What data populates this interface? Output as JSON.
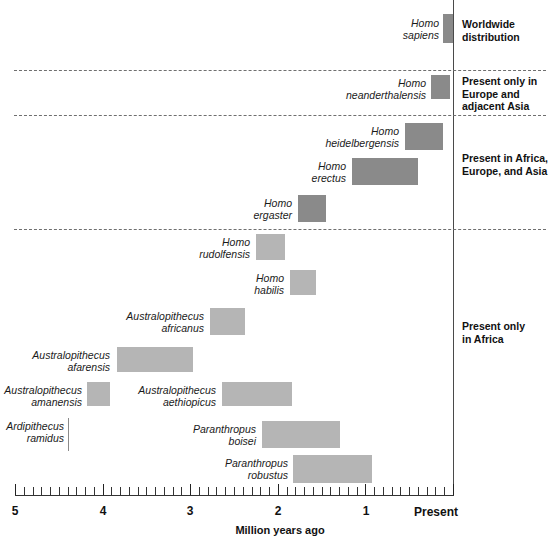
{
  "chart_data": {
    "type": "bar",
    "title": "",
    "xlabel": "Million years ago",
    "ylabel": "",
    "xlim": [
      5,
      0
    ],
    "orientation": "horizontal-timeline",
    "grid": false,
    "axis": {
      "label": "Million years ago",
      "present_label": "Present",
      "tick_labels": [
        "5",
        "4",
        "3",
        "2",
        "1"
      ],
      "tick_values": [
        5,
        4,
        3,
        2,
        1
      ],
      "minor_tick_step": 0.1
    },
    "categories": [
      "Homo sapiens",
      "Homo neanderthalensis",
      "Homo heidelbergensis",
      "Homo erectus",
      "Homo ergaster",
      "Homo rudolfensis",
      "Homo habilis",
      "Australopithecus africanus",
      "Australopithecus afarensis",
      "Australopithecus amanensis",
      "Australopithecus aethiopicus",
      "Ardipithecus ramidus",
      "Paranthropus boisei",
      "Paranthropus robustus"
    ],
    "series": [
      {
        "name": "Temporal range (million years ago)",
        "ranges": [
          {
            "label": "Homo sapiens",
            "start": 0.12,
            "end": 0.0
          },
          {
            "label": "Homo neanderthalensis",
            "start": 0.25,
            "end": 0.03
          },
          {
            "label": "Homo heidelbergensis",
            "start": 0.55,
            "end": 0.12
          },
          {
            "label": "Homo erectus",
            "start": 1.15,
            "end": 0.4
          },
          {
            "label": "Homo ergaster",
            "start": 1.78,
            "end": 1.47
          },
          {
            "label": "Homo rudolfensis",
            "start": 2.26,
            "end": 1.93
          },
          {
            "label": "Homo habilis",
            "start": 1.87,
            "end": 1.57
          },
          {
            "label": "Australopithecus africanus",
            "start": 2.79,
            "end": 2.39
          },
          {
            "label": "Australopithecus afarensis",
            "start": 3.86,
            "end": 2.99
          },
          {
            "label": "Australopithecus amanensis",
            "start": 4.21,
            "end": 3.94
          },
          {
            "label": "Australopithecus aethiopicus",
            "start": 2.66,
            "end": 1.85
          },
          {
            "label": "Ardipithecus ramidus",
            "start": 4.43,
            "end": 4.43
          },
          {
            "label": "Paranthropus boisei",
            "start": 2.2,
            "end": 1.3
          },
          {
            "label": "Paranthropus robustus",
            "start": 1.84,
            "end": 0.93
          }
        ]
      }
    ],
    "annotations": [
      {
        "text": "Worldwide\ndistribution",
        "group": "worldwide"
      },
      {
        "text": "Present only in\nEurope and\nadjacent Asia",
        "group": "europe-asia"
      },
      {
        "text": "Present in Africa,\nEurope, and Asia",
        "group": "africa-europe-asia"
      },
      {
        "text": "Present only\nin Africa",
        "group": "africa-only"
      }
    ],
    "colors": {
      "bar_dark": "#8a8a8a",
      "bar_light": "#b5b5b5",
      "axis": "#333333",
      "divider": "#6f6f6f",
      "background": "#ffffff"
    }
  },
  "species": [
    {
      "name": "Homo\nsapiens",
      "bar": {
        "x": 443,
        "y": 14,
        "w": 10,
        "h": 29
      },
      "label": {
        "x": 393,
        "y": 18,
        "w": 46
      },
      "shade": "dark"
    },
    {
      "name": "Homo\nneanderthalensis",
      "bar": {
        "x": 431,
        "y": 75,
        "w": 19,
        "h": 24
      },
      "label": {
        "x": 320,
        "y": 78,
        "w": 106
      },
      "shade": "dark"
    },
    {
      "name": "Homo\nheidelbergensis",
      "bar": {
        "x": 405,
        "y": 123,
        "w": 38,
        "h": 27
      },
      "label": {
        "x": 294,
        "y": 126,
        "w": 105
      },
      "shade": "dark"
    },
    {
      "name": "Homo\nerectus",
      "bar": {
        "x": 352,
        "y": 158,
        "w": 66,
        "h": 27
      },
      "label": {
        "x": 288,
        "y": 161,
        "w": 58
      },
      "shade": "dark"
    },
    {
      "name": "Homo\nergaster",
      "bar": {
        "x": 298,
        "y": 195,
        "w": 28,
        "h": 27
      },
      "label": {
        "x": 230,
        "y": 198,
        "w": 62
      },
      "shade": "dark"
    },
    {
      "name": "Homo\nrudolfensis",
      "bar": {
        "x": 256,
        "y": 234,
        "w": 29,
        "h": 26
      },
      "label": {
        "x": 180,
        "y": 237,
        "w": 70
      },
      "shade": "light"
    },
    {
      "name": "Homo\nhabilis",
      "bar": {
        "x": 290,
        "y": 270,
        "w": 26,
        "h": 25
      },
      "label": {
        "x": 230,
        "y": 273,
        "w": 54
      },
      "shade": "light"
    },
    {
      "name": "Australopithecus\nafricanus",
      "bar": {
        "x": 210,
        "y": 308,
        "w": 35,
        "h": 27
      },
      "label": {
        "x": 108,
        "y": 311,
        "w": 96
      },
      "shade": "light"
    },
    {
      "name": "Australopithecus\nafarensis",
      "bar": {
        "x": 117,
        "y": 347,
        "w": 76,
        "h": 25
      },
      "label": {
        "x": 14,
        "y": 350,
        "w": 96
      },
      "shade": "light"
    },
    {
      "name": "Australopithecus\namanensis",
      "bar": {
        "x": 87,
        "y": 382,
        "w": 23,
        "h": 24
      },
      "label": {
        "x": 2,
        "y": 385,
        "w": 80
      },
      "shade": "light"
    },
    {
      "name": "Australopithecus\naethiopicus",
      "bar": {
        "x": 222,
        "y": 382,
        "w": 70,
        "h": 24
      },
      "label": {
        "x": 120,
        "y": 385,
        "w": 96
      },
      "shade": "light"
    },
    {
      "name": "Ardipithecus\nramidus",
      "bar": null,
      "marker": {
        "x": 68,
        "y": 418,
        "h": 33
      },
      "label": {
        "x": 2,
        "y": 421,
        "w": 62
      },
      "shade": "light"
    },
    {
      "name": "Paranthropus\nboisei",
      "bar": {
        "x": 262,
        "y": 421,
        "w": 78,
        "h": 27
      },
      "label": {
        "x": 170,
        "y": 424,
        "w": 86
      },
      "shade": "light"
    },
    {
      "name": "Paranthropus\nrobustus",
      "bar": {
        "x": 293,
        "y": 455,
        "w": 79,
        "h": 28
      },
      "label": {
        "x": 200,
        "y": 458,
        "w": 88
      },
      "shade": "light"
    }
  ],
  "groups": [
    {
      "note": "Worldwide\ndistribution",
      "x": 462,
      "y": 18
    },
    {
      "note": "Present only in\nEurope and\nadjacent Asia",
      "x": 462,
      "y": 75
    },
    {
      "note": "Present in Africa,\nEurope, and Asia",
      "x": 462,
      "y": 152
    },
    {
      "note": "Present only\nin Africa",
      "x": 462,
      "y": 320
    }
  ],
  "dividers": [
    70,
    115,
    229
  ],
  "axis_geometry": {
    "left": 15,
    "right": 453,
    "y": 495,
    "px_per_my": 87.6,
    "tick_labels": [
      "5",
      "4",
      "3",
      "2",
      "1"
    ],
    "tick_x": [
      15,
      103,
      190,
      278,
      366
    ],
    "present_label": "Present",
    "present_label_x": 414,
    "title": "Million years ago",
    "title_y": 524
  }
}
